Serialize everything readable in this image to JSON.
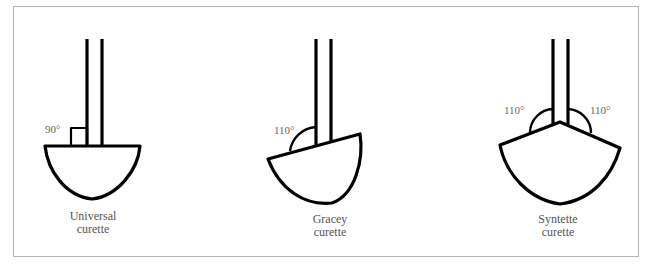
{
  "figure": {
    "instruments": [
      {
        "name": "Universal",
        "label_line1": "Universal",
        "label_line2": "curette",
        "angles": [
          "90°"
        ]
      },
      {
        "name": "Gracey",
        "label_line1": "Gracey",
        "label_line2": "curette",
        "angles": [
          "110°"
        ]
      },
      {
        "name": "Syntette",
        "label_line1": "Syntette",
        "label_line2": "curette",
        "angles": [
          "110°",
          "110°"
        ]
      }
    ]
  },
  "colors": {
    "stroke": "#000000",
    "text": "#555555",
    "frame": "#b5b5b5"
  }
}
